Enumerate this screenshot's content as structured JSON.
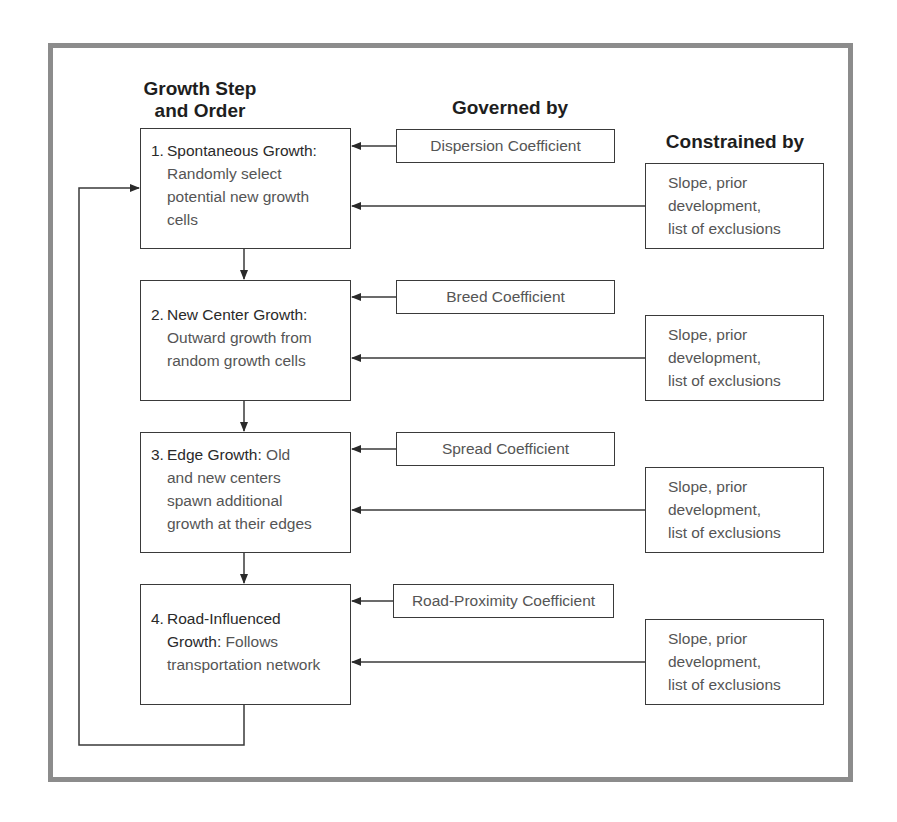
{
  "headers": {
    "step_line1": "Growth Step",
    "step_line2": "and Order",
    "governed": "Governed by",
    "constrained": "Constrained by"
  },
  "steps": [
    {
      "number": "1.",
      "title": "Spontaneous Growth:",
      "title_rest": "",
      "body": [
        "Randomly select",
        "potential new growth",
        "cells"
      ]
    },
    {
      "number": "2.",
      "title": "New Center Growth:",
      "title_rest": "",
      "body": [
        "Outward growth from",
        "random growth cells"
      ]
    },
    {
      "number": "3.",
      "title": "Edge Growth:",
      "title_rest": " Old",
      "body": [
        "and new centers",
        "spawn additional",
        "growth at their edges"
      ]
    },
    {
      "number": "4.",
      "title": "Road-Influenced",
      "title_rest": "",
      "title2": "Growth:",
      "title2_rest": " Follows",
      "body": [
        "transportation network"
      ]
    }
  ],
  "coefficients": [
    "Dispersion Coefficient",
    "Breed Coefficient",
    "Spread Coefficient",
    "Road-Proximity Coefficient"
  ],
  "constraints": [
    [
      "Slope, prior",
      "development,",
      "list of exclusions"
    ],
    [
      "Slope, prior",
      "development,",
      "list of exclusions"
    ],
    [
      "Slope, prior",
      "development,",
      "list of exclusions"
    ],
    [
      "Slope, prior",
      "development,",
      "list of exclusions"
    ]
  ]
}
